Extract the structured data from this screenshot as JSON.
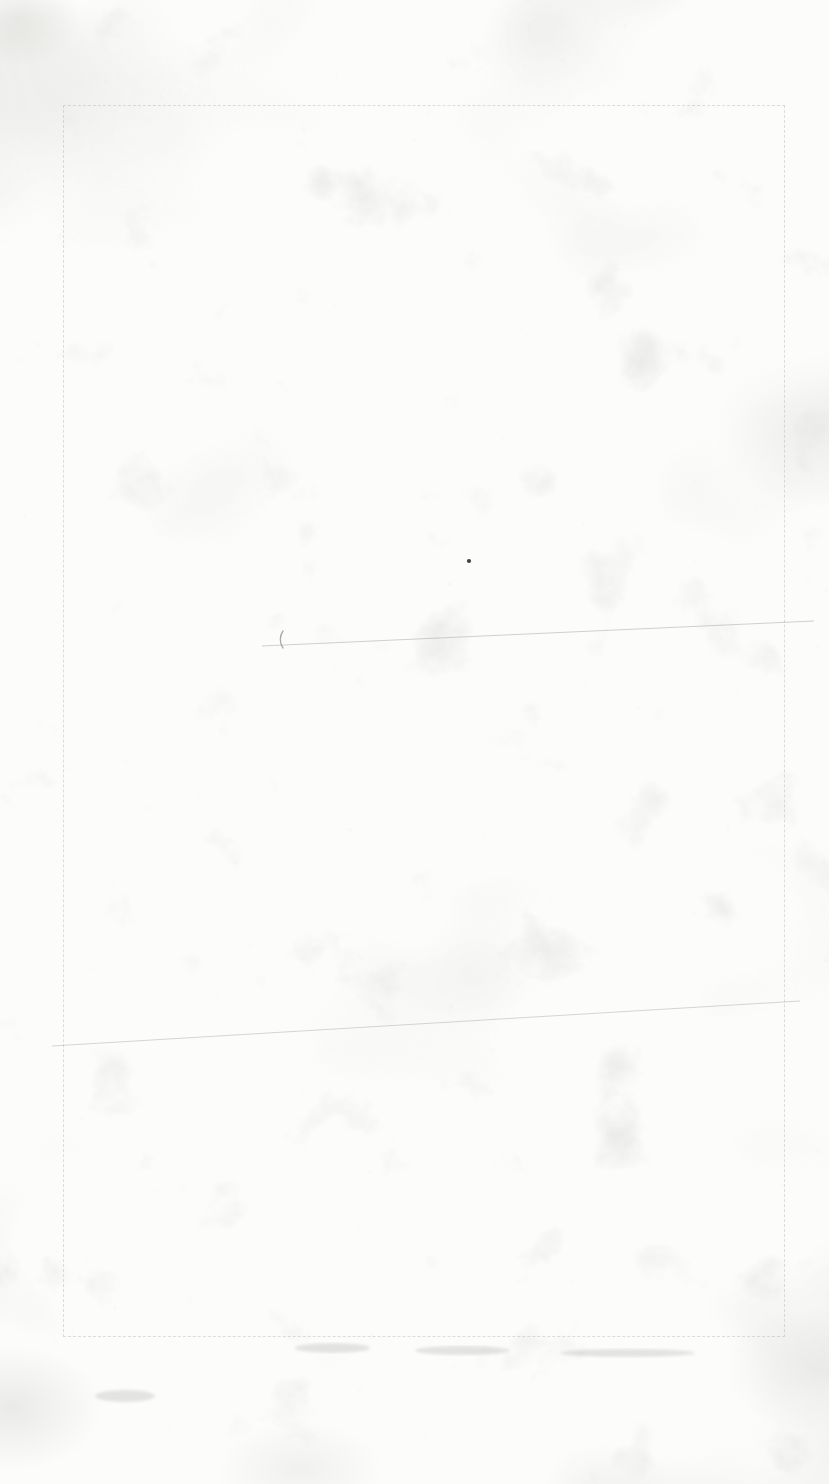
{
  "document": {
    "description": "Blank scanned paper sheet (verso of a map sheet); no legible text, only paper mottling and faint bleed-through",
    "colors": {
      "paper": "#fcfcfb",
      "texture": "#b9b9b3",
      "neatline": "#a9a9a3",
      "pencil": "#8d8d88",
      "speck": "#1f1f1f"
    },
    "neatline": {
      "left": 63,
      "top": 105,
      "right": 783,
      "bottom": 1335,
      "style": "dashed"
    },
    "marks": [
      {
        "kind": "dot",
        "label": "ink-speck-mark",
        "x": 469,
        "y": 561,
        "r": 2.1
      },
      {
        "kind": "arc",
        "label": "pencil-paren-mark",
        "x": 283,
        "y": 631,
        "r": 11,
        "sweep": 17
      },
      {
        "kind": "line",
        "label": "faint-crease-line",
        "x1": 262,
        "y1": 646,
        "x2": 814,
        "y2": 621,
        "opacity": 0.4
      },
      {
        "kind": "line",
        "label": "faint-crease-line",
        "x1": 52,
        "y1": 1046,
        "x2": 800,
        "y2": 1001,
        "opacity": 0.35
      },
      {
        "kind": "smudge",
        "label": "bleedthrough-smudge",
        "x": 295,
        "y": 1343,
        "w": 75,
        "h": 10
      },
      {
        "kind": "smudge",
        "label": "bleedthrough-smudge",
        "x": 415,
        "y": 1346,
        "w": 95,
        "h": 9
      },
      {
        "kind": "smudge",
        "label": "bleedthrough-smudge",
        "x": 560,
        "y": 1349,
        "w": 135,
        "h": 8
      },
      {
        "kind": "smudge",
        "label": "bleedthrough-smudge",
        "x": 95,
        "y": 1390,
        "w": 60,
        "h": 12
      }
    ]
  }
}
